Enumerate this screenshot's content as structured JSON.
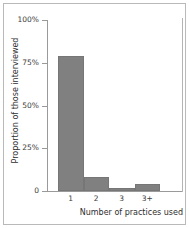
{
  "chart_data": {
    "type": "bar",
    "title": "",
    "subtitle": "",
    "xlabel": "Number of practices used",
    "ylabel": "Proportion of those interviewed",
    "categories": [
      "1",
      "2",
      "3",
      "3+"
    ],
    "values": [
      79,
      8,
      2,
      4
    ],
    "series": [
      {
        "name": "Proportion of those interviewed",
        "values": [
          79,
          8,
          2,
          4
        ]
      }
    ],
    "ylim": [
      0,
      100
    ],
    "ytick_values": [
      0,
      25,
      50,
      75,
      100
    ],
    "ytick_labels": [
      "0",
      "25%",
      "50%",
      "75%",
      "100%"
    ],
    "xtick_labels": [
      "1",
      "2",
      "3",
      "3+"
    ],
    "grid": false,
    "legend": false,
    "legend_position": "none",
    "bar_color": "#808080",
    "axis_color": "#9a9a9a",
    "text_color": "#2e2e2e",
    "background_color": "#ffffff",
    "frame_color": "#b9b9b9",
    "annotations": []
  },
  "figure": {
    "y_ticks": [
      {
        "label": "100%",
        "value": 100
      },
      {
        "label": "75%",
        "value": 75
      },
      {
        "label": "50%",
        "value": 50
      },
      {
        "label": "25%",
        "value": 25
      },
      {
        "label": "0",
        "value": 0
      }
    ],
    "bars": [
      {
        "category": "1",
        "value": 79
      },
      {
        "category": "2",
        "value": 8
      },
      {
        "category": "3",
        "value": 2
      },
      {
        "category": "3+",
        "value": 4
      }
    ],
    "x_axis_title": "Number of practices used",
    "y_axis_title": "Proportion of those interviewed"
  }
}
